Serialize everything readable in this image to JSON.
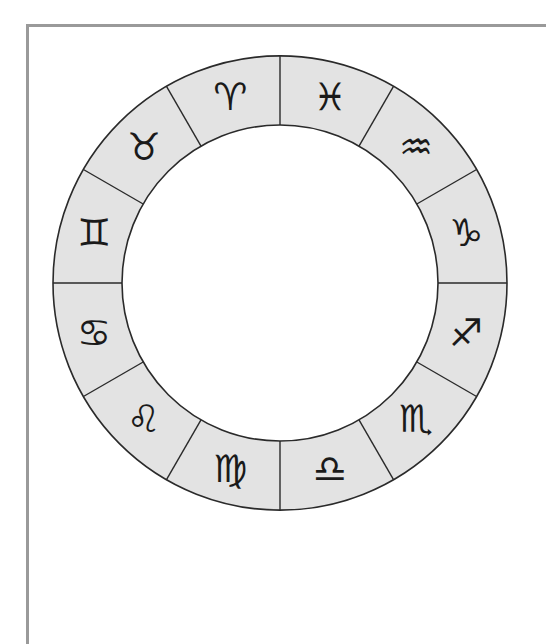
{
  "diagram": {
    "center": [
      280,
      283
    ],
    "outer_radius": 227,
    "inner_radius": 158,
    "ring_fill": "#e3e3e3",
    "stroke_color": "#2a2a2a",
    "frame_color": "#9a9a9a",
    "segments": [
      {
        "name": "aries",
        "symbol": "♈",
        "angle": 105
      },
      {
        "name": "taurus",
        "symbol": "♉",
        "angle": 135
      },
      {
        "name": "gemini",
        "symbol": "♊",
        "angle": 165
      },
      {
        "name": "cancer",
        "symbol": "♋",
        "angle": 195
      },
      {
        "name": "leo",
        "symbol": "♌",
        "angle": 225
      },
      {
        "name": "virgo",
        "symbol": "♍",
        "angle": 255
      },
      {
        "name": "libra",
        "symbol": "♎",
        "angle": 285
      },
      {
        "name": "scorpio",
        "symbol": "♏",
        "angle": 315
      },
      {
        "name": "sagittarius",
        "symbol": "♐",
        "angle": 345
      },
      {
        "name": "capricorn",
        "symbol": "♑",
        "angle": 15
      },
      {
        "name": "aquarius",
        "symbol": "♒",
        "angle": 45
      },
      {
        "name": "pisces",
        "symbol": "♓",
        "angle": 75
      }
    ]
  }
}
